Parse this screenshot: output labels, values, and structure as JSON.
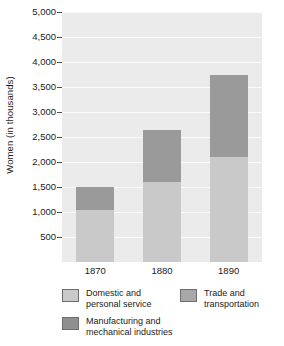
{
  "chart_data": {
    "type": "bar",
    "subtype": "stacked-bar",
    "title": "",
    "xlabel": "",
    "ylabel": "Women (in thousands)",
    "categories": [
      "1870",
      "1880",
      "1890"
    ],
    "ylim": [
      0,
      5000
    ],
    "ytick_values": [
      500,
      1000,
      1500,
      2000,
      2500,
      3000,
      3500,
      4000,
      4500,
      5000
    ],
    "ytick_labels": [
      "500",
      "1,000",
      "1,500",
      "2,000",
      "2,500",
      "3,000",
      "3,500",
      "4,000",
      "4,500",
      "5,000"
    ],
    "grid": true,
    "grid_axis": "y",
    "grid_color": "#fafafa",
    "plot_background": "#ebebeb",
    "legend_position": "bottom",
    "series": [
      {
        "name": "Domestic and\npersonal service",
        "color": "#c9c9c9",
        "values": [
          1050,
          1600,
          2100
        ]
      },
      {
        "name": "Manufacturing and\nmechanical industries",
        "color": "#9a9a9a",
        "values": [
          450,
          1050,
          1650
        ]
      }
    ],
    "totals": [
      1500,
      2650,
      3750
    ]
  },
  "axes": {
    "y_title": "Women (in thousands)",
    "y_ticks": [
      {
        "label": "5,000",
        "value": 5000
      },
      {
        "label": "4,500",
        "value": 4500
      },
      {
        "label": "4,000",
        "value": 4000
      },
      {
        "label": "3,500",
        "value": 3500
      },
      {
        "label": "3,000",
        "value": 3000
      },
      {
        "label": "2,500",
        "value": 2500
      },
      {
        "label": "2,000",
        "value": 2000
      },
      {
        "label": "1,500",
        "value": 1500
      },
      {
        "label": "1,000",
        "value": 1000
      },
      {
        "label": "500",
        "value": 500
      }
    ],
    "x_ticks": [
      {
        "label": "1870"
      },
      {
        "label": "1880"
      },
      {
        "label": "1890"
      }
    ]
  },
  "legend": {
    "items": [
      {
        "label": "Domestic and\npersonal service",
        "color": "#c9c9c9",
        "column": 0,
        "row": 0
      },
      {
        "label": "Trade and\ntransportation",
        "color": "#a8a8a8",
        "column": 1,
        "row": 0
      },
      {
        "label": "Manufacturing and\nmechanical industries",
        "color": "#8f8f8f",
        "column": 0,
        "row": 1
      }
    ]
  }
}
